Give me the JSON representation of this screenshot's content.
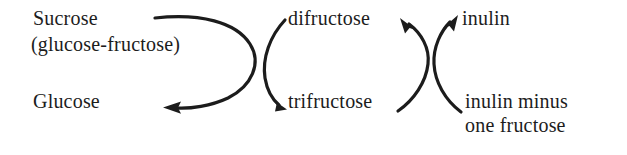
{
  "diagram": {
    "type": "reaction-scheme",
    "background_color": "#ffffff",
    "ink_color": "#1c1c1c",
    "labels": {
      "sucrose": "Sucrose",
      "glucose_fructose": "(glucose-fructose)",
      "glucose": "Glucose",
      "difructose": "difructose",
      "trifructose": "trifructose",
      "inulin": "inulin",
      "inulin_minus": "inulin minus",
      "one_fructose": "one fructose"
    },
    "arrows": [
      {
        "name": "sucrose-to-glucose-arrow",
        "from": "Sucrose (glucose-fructose)",
        "to": "Glucose",
        "shape": "clockwise-hook",
        "head": "left"
      },
      {
        "name": "difructose-to-trifructose-arrow",
        "from": "difructose",
        "to": "trifructose",
        "shape": "left-bowed-arc",
        "head": "down-right"
      },
      {
        "name": "trifructose-to-difructose-arrow",
        "from": "trifructose",
        "to": "difructose",
        "shape": "right-bowed-arc",
        "head": "up-left"
      },
      {
        "name": "inulin-minus-to-inulin-arrow",
        "from": "inulin minus one fructose",
        "to": "inulin",
        "shape": "left-bowed-arc",
        "head": "up-right"
      }
    ]
  }
}
